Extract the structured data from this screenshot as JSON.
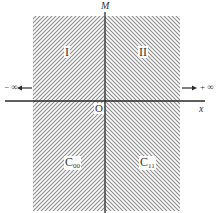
{
  "diagram": {
    "axes": {
      "vertical_label": "M",
      "horizontal_label": "x",
      "origin_label": "O",
      "left_infinity": "− ∞",
      "right_infinity": "+ ∞"
    },
    "regions": [
      {
        "id": "I",
        "label": "I",
        "position": "upper-left",
        "hatch": "forward-slash"
      },
      {
        "id": "II",
        "label": "II",
        "position": "upper-right",
        "hatch": "back-slash"
      },
      {
        "id": "C00",
        "label_main": "C",
        "label_sub": "00",
        "position": "lower-left",
        "hatch": "forward-slash"
      },
      {
        "id": "C11",
        "label_main": "C",
        "label_sub": "11",
        "position": "lower-right",
        "hatch": "back-slash"
      }
    ],
    "colors": {
      "hatch": "#8a8a8a",
      "axis": "#2a2a2a",
      "background": "#ffffff"
    }
  }
}
